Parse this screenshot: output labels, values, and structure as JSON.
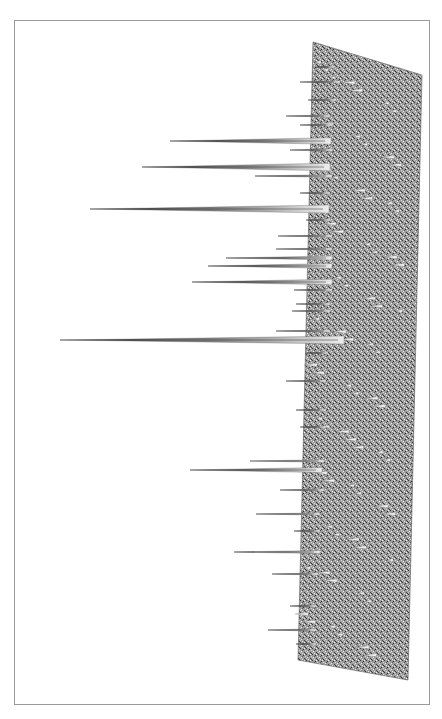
{
  "figure": {
    "type": "3d-surface-peak-map",
    "orientation": "rotated-90",
    "surface_color": "#8a8a8a",
    "spike_color": "#3a3a3a",
    "frame_color": "#9a9a9a",
    "plane": {
      "top_left": [
        313,
        42
      ],
      "top_right": [
        422,
        75
      ],
      "bottom_right": [
        408,
        680
      ],
      "bottom_left": [
        298,
        660
      ]
    },
    "spikes": [
      {
        "y": 67,
        "tip_x": 316,
        "base_x": 320
      },
      {
        "y": 82,
        "tip_x": 300,
        "base_x": 326
      },
      {
        "y": 100,
        "tip_x": 308,
        "base_x": 322
      },
      {
        "y": 116,
        "tip_x": 286,
        "base_x": 316
      },
      {
        "y": 125,
        "tip_x": 300,
        "base_x": 318
      },
      {
        "y": 141,
        "tip_x": 170,
        "base_x": 317
      },
      {
        "y": 150,
        "tip_x": 290,
        "base_x": 318
      },
      {
        "y": 167,
        "tip_x": 142,
        "base_x": 316
      },
      {
        "y": 176,
        "tip_x": 255,
        "base_x": 318
      },
      {
        "y": 193,
        "tip_x": 300,
        "base_x": 316
      },
      {
        "y": 209,
        "tip_x": 90,
        "base_x": 315
      },
      {
        "y": 220,
        "tip_x": 306,
        "base_x": 316
      },
      {
        "y": 236,
        "tip_x": 278,
        "base_x": 318
      },
      {
        "y": 249,
        "tip_x": 276,
        "base_x": 318
      },
      {
        "y": 258,
        "tip_x": 226,
        "base_x": 318
      },
      {
        "y": 266,
        "tip_x": 208,
        "base_x": 318
      },
      {
        "y": 282,
        "tip_x": 192,
        "base_x": 318
      },
      {
        "y": 290,
        "tip_x": 294,
        "base_x": 318
      },
      {
        "y": 304,
        "tip_x": 296,
        "base_x": 316
      },
      {
        "y": 311,
        "tip_x": 292,
        "base_x": 316
      },
      {
        "y": 331,
        "tip_x": 276,
        "base_x": 316
      },
      {
        "y": 340,
        "tip_x": 60,
        "base_x": 330
      },
      {
        "y": 353,
        "tip_x": 306,
        "base_x": 314
      },
      {
        "y": 381,
        "tip_x": 286,
        "base_x": 312
      },
      {
        "y": 410,
        "tip_x": 296,
        "base_x": 312
      },
      {
        "y": 427,
        "tip_x": 300,
        "base_x": 312
      },
      {
        "y": 461,
        "tip_x": 250,
        "base_x": 310
      },
      {
        "y": 470,
        "tip_x": 190,
        "base_x": 308
      },
      {
        "y": 490,
        "tip_x": 280,
        "base_x": 310
      },
      {
        "y": 514,
        "tip_x": 256,
        "base_x": 306
      },
      {
        "y": 531,
        "tip_x": 294,
        "base_x": 306
      },
      {
        "y": 552,
        "tip_x": 234,
        "base_x": 306
      },
      {
        "y": 574,
        "tip_x": 272,
        "base_x": 304
      },
      {
        "y": 606,
        "tip_x": 290,
        "base_x": 302
      },
      {
        "y": 630,
        "tip_x": 268,
        "base_x": 302
      },
      {
        "y": 644,
        "tip_x": 296,
        "base_x": 302
      }
    ]
  },
  "caption": {
    "text": ""
  }
}
